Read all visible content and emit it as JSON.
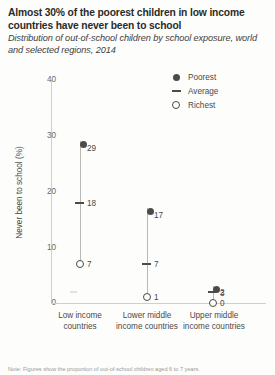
{
  "title": "Almost 30% of the poorest children in low income countries have never been to school",
  "subtitle": "Distribution of out-of-school children by school exposure, world and selected regions, 2014",
  "footnote": "Note: Figures show the proportion of out-of-school children aged 6 to 7 years.",
  "legend": {
    "position": "top-right",
    "items": [
      {
        "label": "Poorest",
        "marker": "filled-circle-icon"
      },
      {
        "label": "Average",
        "marker": "dash-icon"
      },
      {
        "label": "Richest",
        "marker": "open-circle-icon"
      }
    ]
  },
  "colors": {
    "marker": "#4b4b49",
    "stem": "#b9b9b5",
    "axis": "#cfcfcb",
    "text": "#4a4a48",
    "title": "#2b2b29",
    "background": "#fdfdfc"
  },
  "chart_data": {
    "type": "scatter",
    "title": "Almost 30% of the poorest children in low income countries have never been to school",
    "subtitle": "Distribution of out-of-school children by school exposure, world and selected regions, 2014",
    "xlabel": "",
    "ylabel": "Never been to school (%)",
    "ylim": [
      0,
      40
    ],
    "yticks": [
      0,
      10,
      20,
      30,
      40
    ],
    "ytick_labels": [
      "0",
      "10",
      "20",
      "30",
      "40"
    ],
    "grid": false,
    "legend_position": "top-right",
    "categories": [
      "Low income countries",
      "Lower middle income countries",
      "Upper middle income countries"
    ],
    "series": [
      {
        "name": "Poorest",
        "values": [
          29,
          17,
          3
        ],
        "labels": [
          "29",
          "17",
          "3"
        ]
      },
      {
        "name": "Average",
        "values": [
          18,
          7,
          2
        ],
        "labels": [
          "18",
          "7",
          "2"
        ]
      },
      {
        "name": "Richest",
        "values": [
          7,
          1,
          0
        ],
        "labels": [
          "7",
          "1",
          "0"
        ]
      }
    ]
  }
}
